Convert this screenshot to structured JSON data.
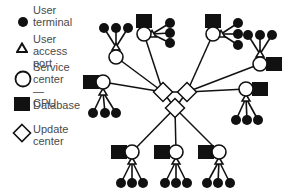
{
  "legend": {
    "items": [
      {
        "icon": "filled-circle-icon",
        "label": "User\nterminal"
      },
      {
        "icon": "triangle-icon",
        "label": "User access\nport"
      },
      {
        "icon": "open-circle-icon",
        "label": "Service\ncenter\n— CPU"
      },
      {
        "icon": "filled-square-icon",
        "label": "Database"
      },
      {
        "icon": "diamond-icon",
        "label": "Update\ncenter"
      }
    ]
  },
  "diagram": {
    "colors": {
      "ink": "#111111",
      "fill_white": "#ffffff"
    },
    "update_centers": [
      {
        "id": "uc-left",
        "x": 163,
        "y": 92
      },
      {
        "id": "uc-right",
        "x": 187,
        "y": 92
      },
      {
        "id": "uc-bottom",
        "x": 175,
        "y": 108
      }
    ],
    "clusters": [
      {
        "cpu": [
          116,
          57
        ],
        "port": [
          116,
          47
        ],
        "db": null,
        "terminals": [
          [
            104,
            28
          ],
          [
            116,
            28
          ],
          [
            128,
            28
          ]
        ],
        "hub": "uc-left"
      },
      {
        "cpu": [
          144,
          34
        ],
        "port": [
          152,
          34
        ],
        "db": [
          144,
          21
        ],
        "terminals": [
          [
            170,
            23
          ],
          [
            170,
            33
          ],
          [
            170,
            43
          ]
        ],
        "hub": "uc-left"
      },
      {
        "cpu": [
          213,
          34
        ],
        "port": [
          221,
          34
        ],
        "db": [
          213,
          21
        ],
        "terminals": [
          [
            238,
            23
          ],
          [
            238,
            34
          ],
          [
            238,
            45
          ]
        ],
        "hub": "uc-right"
      },
      {
        "cpu": [
          260,
          64
        ],
        "port": [
          260,
          54
        ],
        "db": [
          274,
          64
        ],
        "terminals": [
          [
            248,
            35
          ],
          [
            260,
            35
          ],
          [
            272,
            35
          ]
        ],
        "hub": "uc-right"
      },
      {
        "cpu": [
          246,
          89
        ],
        "port": [
          246,
          98
        ],
        "db": [
          260,
          89
        ],
        "terminals": [
          [
            236,
            120
          ],
          [
            247,
            120
          ],
          [
            258,
            120
          ]
        ],
        "hub": "uc-right"
      },
      {
        "cpu": [
          103,
          82
        ],
        "port": [
          103,
          92
        ],
        "db": [
          91,
          82
        ],
        "terminals": [
          [
            93,
            113
          ],
          [
            105,
            113
          ],
          [
            116,
            113
          ]
        ],
        "hub": "uc-left"
      },
      {
        "cpu": [
          132,
          152
        ],
        "port": [
          132,
          161
        ],
        "db": [
          119,
          152
        ],
        "terminals": [
          [
            121,
            183
          ],
          [
            132,
            183
          ],
          [
            143,
            183
          ]
        ],
        "hub": "uc-bottom"
      },
      {
        "cpu": [
          176,
          152
        ],
        "port": [
          176,
          161
        ],
        "db": [
          162,
          152
        ],
        "terminals": [
          [
            165,
            183
          ],
          [
            176,
            183
          ],
          [
            187,
            183
          ]
        ],
        "hub": "uc-bottom"
      },
      {
        "cpu": [
          219,
          152
        ],
        "port": [
          219,
          161
        ],
        "db": [
          206,
          152
        ],
        "terminals": [
          [
            207,
            183
          ],
          [
            218,
            183
          ],
          [
            230,
            183
          ]
        ],
        "hub": "uc-bottom"
      }
    ]
  }
}
